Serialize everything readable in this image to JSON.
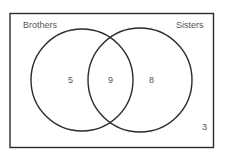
{
  "diagram": {
    "type": "venn",
    "sets": [
      {
        "label": "Brothers",
        "only": "5"
      },
      {
        "label": "Sisters",
        "only": "8"
      }
    ],
    "intersection": "9",
    "outside": "3",
    "colors": {
      "stroke": "#2b2b2b",
      "text": "#555555",
      "background": "#ffffff"
    }
  }
}
